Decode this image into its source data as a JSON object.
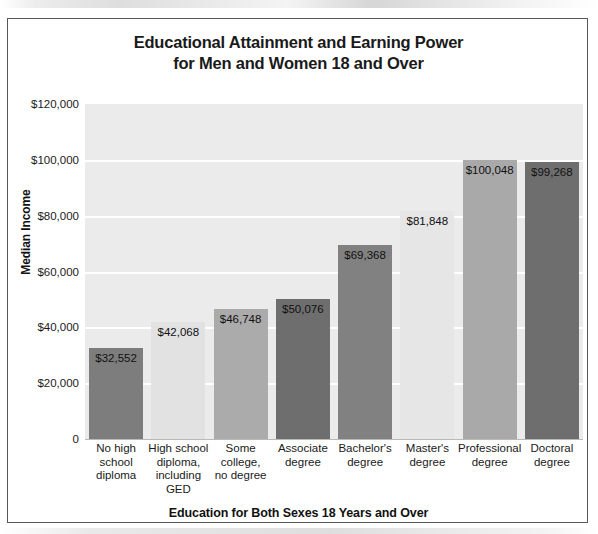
{
  "chart_data": {
    "type": "bar",
    "title": "Educational Attainment and Earning Power for Men and Women 18 and Over",
    "title_line1": "Educational Attainment and Earning Power",
    "title_line2": "for Men and Women 18 and Over",
    "xlabel": "Education for Both Sexes 18 Years and Over",
    "ylabel": "Median Income",
    "ylim": [
      0,
      120000
    ],
    "ytick_values": [
      120000,
      100000,
      80000,
      60000,
      40000,
      20000,
      0
    ],
    "ytick_labels": [
      "$120,000",
      "$100,000",
      "$80,000",
      "$60,000",
      "$40,000",
      "$20,000",
      "0"
    ],
    "grid": true,
    "legend": "none",
    "categories": [
      "No high school diploma",
      "High school diploma, including GED",
      "Some college, no degree",
      "Associate degree",
      "Bachelor's degree",
      "Master's degree",
      "Professional degree",
      "Doctoral degree"
    ],
    "category_lines": [
      [
        "No high",
        "school",
        "diploma"
      ],
      [
        "High school",
        "diploma,",
        "including",
        "GED"
      ],
      [
        "Some",
        "college,",
        "no degree"
      ],
      [
        "Associate",
        "degree"
      ],
      [
        "Bachelor's",
        "degree"
      ],
      [
        "Master's",
        "degree"
      ],
      [
        "Professional",
        "degree"
      ],
      [
        "Doctoral",
        "degree"
      ]
    ],
    "values": [
      32552,
      42068,
      46748,
      50076,
      69368,
      81848,
      100048,
      99268
    ],
    "value_labels": [
      "$32,552",
      "$42,068",
      "$46,748",
      "$50,076",
      "$69,368",
      "$81,848",
      "$100,048",
      "$99,268"
    ],
    "bar_colors": [
      "#7d7d7d",
      "#e2e2e2",
      "#ababab",
      "#6e6e6e",
      "#818181",
      "#e6e6e6",
      "#a9a9a9",
      "#6e6e6e"
    ],
    "plot_background": "#ebebeb",
    "gridline_color": "#ffffff",
    "border_color": "#58585a"
  }
}
